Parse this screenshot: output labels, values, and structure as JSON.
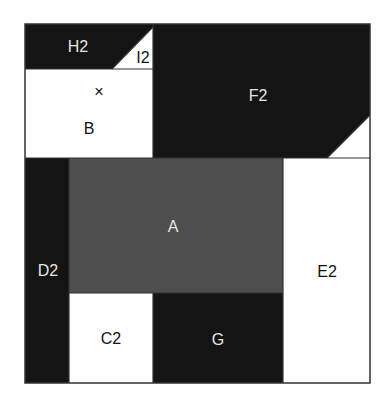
{
  "diagram": {
    "type": "rectangular-partition",
    "colors": {
      "black": "#141414",
      "gray": "#4e4e4e",
      "white": "#ffffff",
      "border": "#333333",
      "label_light": "#e6e6e6",
      "label_dark": "#111111"
    },
    "regions": [
      {
        "id": "H2",
        "label": "H2",
        "fill": "black"
      },
      {
        "id": "I2",
        "label": "I2",
        "fill": "white"
      },
      {
        "id": "B",
        "label": "B",
        "fill": "white",
        "marker": "×"
      },
      {
        "id": "F2",
        "label": "F2",
        "fill": "black"
      },
      {
        "id": "A",
        "label": "A",
        "fill": "gray"
      },
      {
        "id": "D2",
        "label": "D2",
        "fill": "black"
      },
      {
        "id": "E2",
        "label": "E2",
        "fill": "white"
      },
      {
        "id": "C2",
        "label": "C2",
        "fill": "white"
      },
      {
        "id": "G",
        "label": "G",
        "fill": "black"
      }
    ],
    "labels": {
      "H2": "H2",
      "I2": "I2",
      "B": "B",
      "B_marker": "×",
      "F2": "F2",
      "A": "A",
      "D2": "D2",
      "E2": "E2",
      "C2": "C2",
      "G": "G"
    }
  }
}
